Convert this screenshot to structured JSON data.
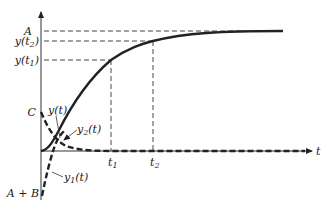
{
  "diagram": {
    "type": "response-curves",
    "axes": {
      "x_label": "t",
      "y_axis_ticks": [
        {
          "label": "A",
          "y_px": 31
        },
        {
          "label": "y(t₂)",
          "y_px": 41
        },
        {
          "label": "y(t₁)",
          "y_px": 60
        },
        {
          "label": "C",
          "y_px": 112
        },
        {
          "label": "A + B",
          "y_px": 193
        }
      ],
      "x_axis_ticks": [
        {
          "label": "t₁",
          "x_px": 111
        },
        {
          "label": "t₂",
          "x_px": 153
        }
      ]
    },
    "labels": {
      "A": "A",
      "y_t2_main": "y(t",
      "y_t2_sub": "2",
      "y_t1_main": "y(t",
      "y_t1_sub": "1",
      "close": ")",
      "C": "C",
      "A_plus_B": "A + B",
      "t": "t",
      "t1_main": "t",
      "t1_sub": "1",
      "t2_main": "t",
      "t2_sub": "2",
      "yt": "y(t)",
      "y1_main": "y",
      "y1_sub": "1",
      "y1_tail": "(t)",
      "y2_main": "y",
      "y2_sub": "2",
      "y2_tail": "(t)"
    },
    "curves": [
      {
        "name": "y(t)",
        "style": "solid",
        "description": "rises from 0 and approaches A asymptotically"
      },
      {
        "name": "y1(t)",
        "style": "dashed",
        "description": "starts at A + B (negative) and rises toward 0"
      },
      {
        "name": "y2(t)",
        "style": "dashed",
        "description": "starts at C and decays toward 0"
      }
    ],
    "colors": {
      "ink": "#222222",
      "background": "#ffffff"
    }
  }
}
